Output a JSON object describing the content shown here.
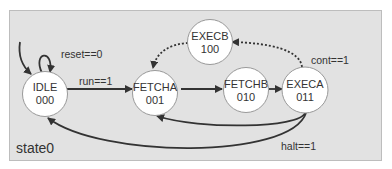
{
  "diagram": {
    "type": "finite-state-machine",
    "name": "state0",
    "colors": {
      "panel_bg": "#e2e2e2",
      "state_fill": "#ffffff",
      "edge": "#333333"
    },
    "states": [
      {
        "id": "idle",
        "name": "IDLE",
        "code": "000",
        "initial": true
      },
      {
        "id": "fetcha",
        "name": "FETCHA",
        "code": "001"
      },
      {
        "id": "fetchb",
        "name": "FETCHB",
        "code": "010"
      },
      {
        "id": "execa",
        "name": "EXECA",
        "code": "011"
      },
      {
        "id": "execb",
        "name": "EXECB",
        "code": "100"
      }
    ],
    "transitions": [
      {
        "from": "IDLE",
        "to": "IDLE",
        "label": "reset==0",
        "style": "solid"
      },
      {
        "from": "IDLE",
        "to": "FETCHA",
        "label": "run==1",
        "style": "solid"
      },
      {
        "from": "FETCHA",
        "to": "FETCHB",
        "label": "",
        "style": "solid"
      },
      {
        "from": "FETCHB",
        "to": "EXECA",
        "label": "",
        "style": "solid"
      },
      {
        "from": "EXECA",
        "to": "EXECB",
        "label": "cont==1",
        "style": "dotted"
      },
      {
        "from": "EXECB",
        "to": "FETCHA",
        "label": "",
        "style": "dotted"
      },
      {
        "from": "EXECA",
        "to": "FETCHA",
        "label": "",
        "style": "solid"
      },
      {
        "from": "EXECA",
        "to": "IDLE",
        "label": "halt==1",
        "style": "solid"
      }
    ]
  }
}
